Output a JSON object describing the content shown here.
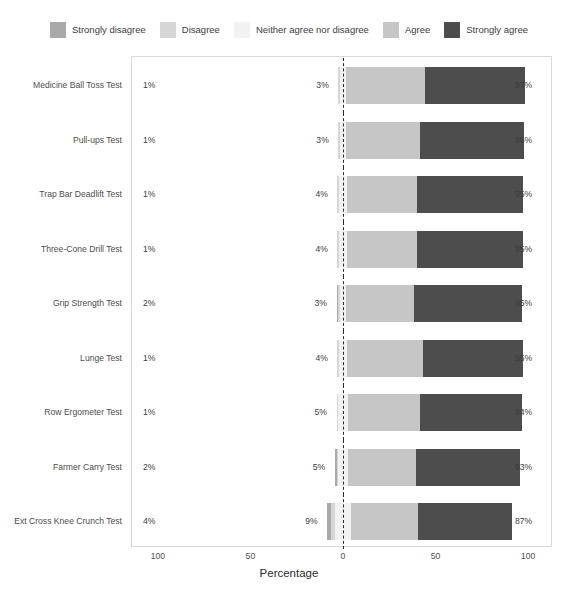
{
  "chart_data": {
    "type": "bar",
    "subtype": "diverging-stacked-likert",
    "title": "",
    "xlabel": "Percentage",
    "ylabel": "",
    "xlim": [
      -100,
      100
    ],
    "xticks": [
      {
        "value": -100,
        "label": "100"
      },
      {
        "value": -50,
        "label": "50"
      },
      {
        "value": 0,
        "label": "0"
      },
      {
        "value": 50,
        "label": "50"
      },
      {
        "value": 100,
        "label": "100"
      }
    ],
    "grid": false,
    "legend_position": "top",
    "zero_reference_line": true,
    "legend": [
      {
        "label": "Strongly disagree",
        "color": "#a9a9a9"
      },
      {
        "label": "Disagree",
        "color": "#d6d6d6"
      },
      {
        "label": "Neither agree nor disagree",
        "color": "#f2f2f2"
      },
      {
        "label": "Agree",
        "color": "#c6c6c6"
      },
      {
        "label": "Strongly agree",
        "color": "#4d4d4d"
      }
    ],
    "categories": [
      "Medicine Ball Toss Test",
      "Pull-ups Test",
      "Trap Bar Deadlift Test",
      "Three-Cone Drill Test",
      "Grip Strength Test",
      "Lunge Test",
      "Row Ergometer Test",
      "Farmer Carry Test",
      "Ext Cross Knee Crunch Test"
    ],
    "series": [
      {
        "name": "Strongly disagree",
        "color": "#a9a9a9",
        "values": [
          0,
          0,
          0,
          0,
          1,
          0,
          0,
          1,
          2
        ]
      },
      {
        "name": "Disagree",
        "color": "#d6d6d6",
        "values": [
          1,
          1,
          1,
          1,
          1,
          1,
          1,
          1,
          2
        ]
      },
      {
        "name": "Neither agree nor disagree",
        "color": "#f2f2f2",
        "values": [
          3,
          3,
          4,
          4,
          3,
          4,
          5,
          5,
          9
        ]
      },
      {
        "name": "Agree",
        "color": "#c6c6c6",
        "values": [
          43,
          40,
          38,
          38,
          37,
          41,
          39,
          37,
          36
        ]
      },
      {
        "name": "Strongly agree",
        "color": "#4d4d4d",
        "values": [
          54,
          56,
          57,
          57,
          58,
          54,
          55,
          56,
          51
        ]
      }
    ],
    "rows": [
      {
        "category": "Medicine Ball Toss Test",
        "negative_label": "1%",
        "neutral_label": "3%",
        "positive_label": "97%",
        "negative": 1,
        "neutral": 3,
        "positive": 97,
        "strongly_disagree": 0,
        "disagree": 1,
        "agree": 43,
        "strongly_agree": 54
      },
      {
        "category": "Pull-ups Test",
        "negative_label": "1%",
        "neutral_label": "3%",
        "positive_label": "96%",
        "negative": 1,
        "neutral": 3,
        "positive": 96,
        "strongly_disagree": 0,
        "disagree": 1,
        "agree": 40,
        "strongly_agree": 56
      },
      {
        "category": "Trap Bar Deadlift Test",
        "negative_label": "1%",
        "neutral_label": "4%",
        "positive_label": "95%",
        "negative": 1,
        "neutral": 4,
        "positive": 95,
        "strongly_disagree": 0,
        "disagree": 1,
        "agree": 38,
        "strongly_agree": 57
      },
      {
        "category": "Three-Cone Drill Test",
        "negative_label": "1%",
        "neutral_label": "4%",
        "positive_label": "95%",
        "negative": 1,
        "neutral": 4,
        "positive": 95,
        "strongly_disagree": 0,
        "disagree": 1,
        "agree": 38,
        "strongly_agree": 57
      },
      {
        "category": "Grip Strength Test",
        "negative_label": "2%",
        "neutral_label": "3%",
        "positive_label": "95%",
        "negative": 2,
        "neutral": 3,
        "positive": 95,
        "strongly_disagree": 1,
        "disagree": 1,
        "agree": 37,
        "strongly_agree": 58
      },
      {
        "category": "Lunge Test",
        "negative_label": "1%",
        "neutral_label": "4%",
        "positive_label": "95%",
        "negative": 1,
        "neutral": 4,
        "positive": 95,
        "strongly_disagree": 0,
        "disagree": 1,
        "agree": 41,
        "strongly_agree": 54
      },
      {
        "category": "Row Ergometer Test",
        "negative_label": "1%",
        "neutral_label": "5%",
        "positive_label": "94%",
        "negative": 1,
        "neutral": 5,
        "positive": 94,
        "strongly_disagree": 0,
        "disagree": 1,
        "agree": 39,
        "strongly_agree": 55
      },
      {
        "category": "Farmer Carry Test",
        "negative_label": "2%",
        "neutral_label": "5%",
        "positive_label": "93%",
        "negative": 2,
        "neutral": 5,
        "positive": 93,
        "strongly_disagree": 1,
        "disagree": 1,
        "agree": 37,
        "strongly_agree": 56
      },
      {
        "category": "Ext Cross Knee Crunch Test",
        "negative_label": "4%",
        "neutral_label": "9%",
        "positive_label": "87%",
        "negative": 4,
        "neutral": 9,
        "positive": 87,
        "strongly_disagree": 2,
        "disagree": 2,
        "agree": 36,
        "strongly_agree": 51
      }
    ]
  }
}
